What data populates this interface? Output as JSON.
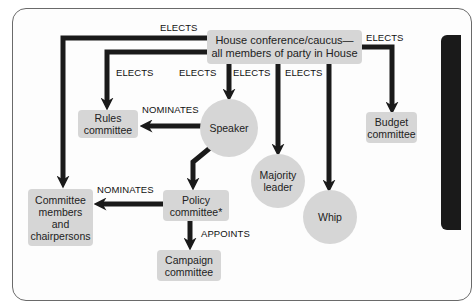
{
  "nodes": {
    "house": {
      "line1": "House conference/caucus—",
      "line2": "all members of party in House"
    },
    "rules": {
      "line1": "Rules",
      "line2": "committee"
    },
    "speaker": {
      "label": "Speaker"
    },
    "budget": {
      "line1": "Budget",
      "line2": "committee"
    },
    "majority": {
      "line1": "Majority",
      "line2": "leader"
    },
    "whip": {
      "label": "Whip"
    },
    "policy": {
      "line1": "Policy",
      "line2": "committee*"
    },
    "members": {
      "line1": "Committee",
      "line2": "members",
      "line3": "and",
      "line4": "chairpersons"
    },
    "campaign": {
      "line1": "Campaign",
      "line2": "committee"
    }
  },
  "edges": {
    "elects_members": "ELECTS",
    "elects_rules": "ELECTS",
    "elects_speaker": "ELECTS",
    "elects_majority": "ELECTS",
    "elects_whip": "ELECTS",
    "elects_budget": "ELECTS",
    "speaker_nominates_rules": "NOMINATES",
    "policy_nominates_members": "NOMINATES",
    "policy_appoints_campaign": "APPOINTS"
  },
  "colors": {
    "node_fill": "#d6d6d6",
    "arrow": "#1a1a1a",
    "sidebar": "#1a1a1a"
  }
}
